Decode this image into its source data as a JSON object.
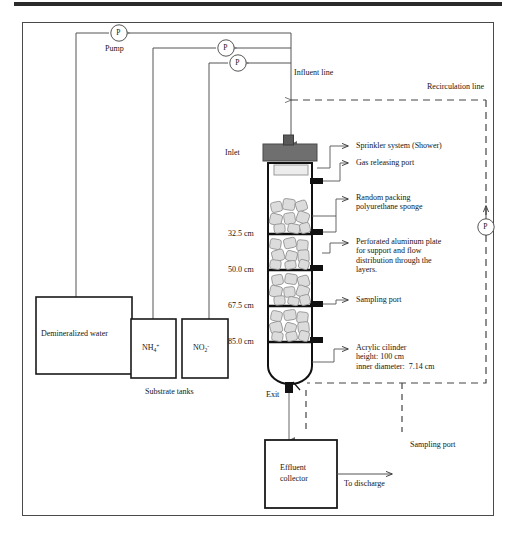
{
  "figure": {
    "kind": "process-flow-diagram"
  },
  "pumps": [
    {
      "id": "pump-1",
      "letter": "P",
      "label": "Pump"
    },
    {
      "id": "pump-2",
      "letter": "P",
      "label": ""
    },
    {
      "id": "pump-3",
      "letter": "P",
      "label": ""
    },
    {
      "id": "pump-recirculation",
      "letter": "P",
      "label": ""
    }
  ],
  "tanks": [
    {
      "id": "demineralized-water-tank",
      "label": "Demineralized water"
    },
    {
      "id": "ammonium-tank",
      "label": "NH4+",
      "formula_base": "NH",
      "formula_sub": "4",
      "formula_sup": "+"
    },
    {
      "id": "nitrite-tank",
      "label": "NO2-",
      "formula_base": "NO",
      "formula_sub": "2",
      "formula_sup": "-"
    }
  ],
  "tank_group_caption": "Substrate tanks",
  "lines": {
    "influent": "Influent line",
    "recirculation": "Recirculation line"
  },
  "reactor": {
    "inlet_label": "Inlet",
    "exit_label": "Exit",
    "height_marks": [
      "32.5 cm",
      "50.0 cm",
      "67.5 cm",
      "85.0 cm"
    ]
  },
  "callouts": [
    {
      "id": "sprinkler",
      "text": "Sprinkler system (Shower)"
    },
    {
      "id": "gas-releasing-port",
      "text": "Gas releasing port"
    },
    {
      "id": "random-packing",
      "text": "Random packing\npolyurethane sponge"
    },
    {
      "id": "perforated-plate",
      "text": "Perforated aluminum plate\nfor support and flow\ndistribution through the\nlayers."
    },
    {
      "id": "sampling-port",
      "text": "Sampling port"
    },
    {
      "id": "acrylic-cylinder",
      "text": "Acrylic cilinder\nheight: 100 cm\ninner diameter:  7.14 cm"
    },
    {
      "id": "sampling-port-effluent",
      "text": "Sampling port"
    }
  ],
  "effluent": {
    "collector_line1": "Effluent",
    "collector_line2": "collector",
    "discharge": "To discharge"
  },
  "colors": {
    "line": "#555555",
    "dark_line": "#1a1a1a",
    "cap_fill": "#6f6f6f",
    "shower_fill": "#e3e3e3",
    "sponge_fill": "#d9d9d9",
    "port_black": "#111111",
    "frame": "#4a4a4a"
  }
}
